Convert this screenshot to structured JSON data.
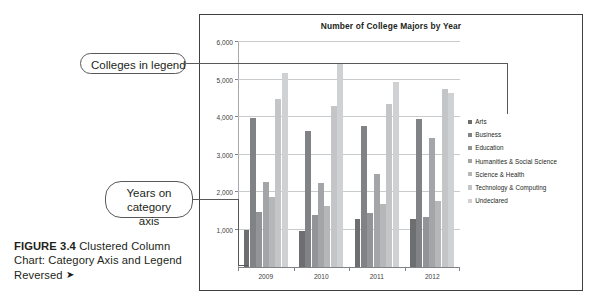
{
  "figure": {
    "label": "FIGURE 3.4",
    "caption": "Clustered Column Chart: Category Axis and Legend Reversed",
    "arrow": "➤"
  },
  "callouts": [
    {
      "id": "legend",
      "text": "Colleges in legend"
    },
    {
      "id": "axis",
      "text": "Years on category axis"
    }
  ],
  "chart_data": {
    "type": "bar",
    "title": "Number of College Majors by Year",
    "xlabel": "",
    "ylabel": "",
    "ylim": [
      0,
      6000
    ],
    "yticks": [
      1000,
      2000,
      3000,
      4000,
      5000,
      6000
    ],
    "ytick_labels": [
      "1,000",
      "2,000",
      "3,000",
      "4,000",
      "5,000",
      "6,000"
    ],
    "grid": true,
    "legend_position": "right",
    "categories": [
      "2009",
      "2010",
      "2011",
      "2012"
    ],
    "series": [
      {
        "name": "Arts",
        "color": "#6d6e70",
        "values": [
          980,
          960,
          1270,
          1270
        ]
      },
      {
        "name": "Business",
        "color": "#808285",
        "values": [
          3980,
          3640,
          3760,
          3960
        ]
      },
      {
        "name": "Education",
        "color": "#929497",
        "values": [
          1480,
          1400,
          1440,
          1340
        ]
      },
      {
        "name": "Humanities & Social Science",
        "color": "#a3a5a8",
        "values": [
          2270,
          2230,
          2470,
          3450
        ]
      },
      {
        "name": "Science & Health",
        "color": "#b5b7b9",
        "values": [
          1880,
          1620,
          1680,
          1760
        ]
      },
      {
        "name": "Technology & Computing",
        "color": "#c3c5c7",
        "values": [
          4490,
          4290,
          4360,
          4740
        ]
      },
      {
        "name": "Undeclared",
        "color": "#cfd1d3",
        "values": [
          5170,
          5430,
          4940,
          4650
        ]
      }
    ]
  }
}
